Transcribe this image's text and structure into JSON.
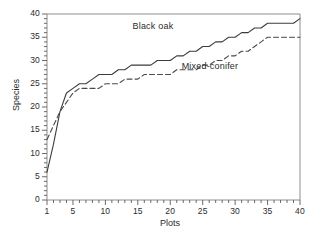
{
  "chart_data": {
    "type": "line",
    "title": "",
    "xlabel": "Plots",
    "ylabel": "Species",
    "xlim": [
      1,
      40
    ],
    "ylim": [
      0,
      40
    ],
    "grid": false,
    "legend_position": "inline-annotation",
    "xticks": [
      1,
      5,
      10,
      15,
      20,
      25,
      30,
      35,
      40
    ],
    "yticks": [
      0,
      5,
      10,
      15,
      20,
      25,
      30,
      35,
      40
    ],
    "xtick_labels": [
      "1",
      "5",
      "10",
      "15",
      "20",
      "25",
      "30",
      "35",
      "40"
    ],
    "ytick_labels": [
      "0",
      "5",
      "10",
      "15",
      "20",
      "25",
      "30",
      "35",
      "40"
    ],
    "x": [
      1,
      2,
      3,
      4,
      5,
      6,
      7,
      8,
      9,
      10,
      11,
      12,
      13,
      14,
      15,
      16,
      17,
      18,
      19,
      20,
      21,
      22,
      23,
      24,
      25,
      26,
      27,
      28,
      29,
      30,
      31,
      32,
      33,
      34,
      35,
      36,
      37,
      38,
      39,
      40
    ],
    "series": [
      {
        "name": "Black oak",
        "style": "solid",
        "color": "#3c3c3c",
        "values": [
          6,
          12,
          19,
          23,
          24,
          25,
          25,
          26,
          27,
          27,
          27,
          28,
          28,
          29,
          29,
          29,
          29,
          30,
          30,
          30,
          31,
          31,
          32,
          32,
          33,
          33,
          34,
          34,
          35,
          35,
          36,
          36,
          37,
          37,
          38,
          38,
          38,
          38,
          38,
          39
        ]
      },
      {
        "name": "Mixed-conifer",
        "style": "dashed",
        "color": "#4a4a4a",
        "values": [
          13,
          16,
          19,
          21,
          23,
          24,
          24,
          24,
          24,
          25,
          25,
          25,
          26,
          26,
          26,
          27,
          27,
          27,
          27,
          27,
          28,
          28,
          28,
          28,
          29,
          29,
          30,
          30,
          31,
          31,
          32,
          32,
          33,
          34,
          35,
          35,
          35,
          35,
          35,
          35
        ]
      }
    ],
    "annotations": [
      {
        "text": "Black oak",
        "x": 18.5,
        "y": 37.2
      },
      {
        "text": "Mixed-conifer",
        "x": 27.0,
        "y": 28.6
      }
    ]
  }
}
